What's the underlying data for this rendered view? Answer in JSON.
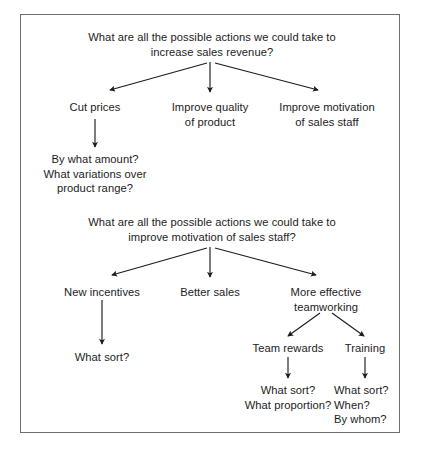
{
  "diagram": {
    "title_block_1": "What are all the possible actions we could take to\nincrease sales revenue?",
    "title_block_2": "What are all the possible actions we could take to\nimprove motivation of sales staff?",
    "branches_1": {
      "left": "Cut prices",
      "middle": "Improve quality\nof product",
      "right": "Improve motivation\nof sales staff"
    },
    "sub_1": {
      "cut_prices_questions": "By what amount?\nWhat variations over\nproduct range?"
    },
    "branches_2": {
      "left": "New incentives",
      "middle": "Better sales",
      "right": "More effective\nteamworking"
    },
    "sub_2": {
      "new_incentives_question": "What sort?",
      "teamworking_left": "Team rewards",
      "teamworking_right": "Training",
      "team_rewards_questions": "What sort?\nWhat proportion?",
      "training_questions": "What sort?\nWhen?\nBy whom?"
    },
    "colors": {
      "ink": "#1c1c1c",
      "frame": "#6e6e6e",
      "background": "#ffffff"
    }
  }
}
